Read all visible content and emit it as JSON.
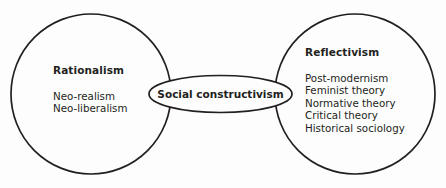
{
  "diagram": {
    "type": "venn-overlap-diagram",
    "stroke_color": "#231f20",
    "background_color": "#fdfdfd",
    "left_circle": {
      "heading": "Rationalism",
      "items": [
        "Neo-realism",
        "Neo-liberalism"
      ]
    },
    "center_ellipse": {
      "label": "Social constructivism"
    },
    "right_circle": {
      "heading": "Reflectivism",
      "items": [
        "Post-modernism",
        "Feminist theory",
        "Normative theory",
        "Critical theory",
        "Historical sociology"
      ]
    }
  }
}
